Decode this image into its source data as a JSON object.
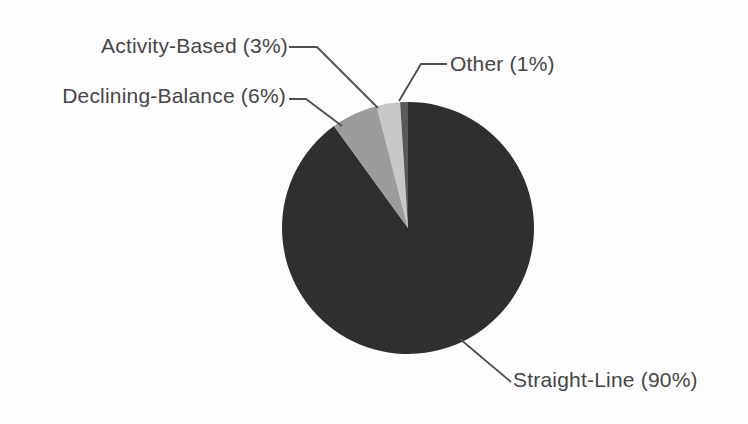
{
  "chart_data": {
    "type": "pie",
    "title": "",
    "unit": "%",
    "direction": "clockwise",
    "start_angle_deg": 0,
    "legend_position": "callout-labels",
    "background_color": "#fdfdfd",
    "leader_line_color": "#4d4d4d",
    "label_text_color": "#464646",
    "slices": [
      {
        "label": "Straight-Line",
        "value": 90,
        "display": "Straight-Line (90%)",
        "color": "#2f2f2f"
      },
      {
        "label": "Declining-Balance",
        "value": 6,
        "display": "Declining-Balance (6%)",
        "color": "#9c9c9c"
      },
      {
        "label": "Activity-Based",
        "value": 3,
        "display": "Activity-Based (3%)",
        "color": "#c7c7c7"
      },
      {
        "label": "Other",
        "value": 1,
        "display": "Other (1%)",
        "color": "#595959"
      }
    ]
  }
}
